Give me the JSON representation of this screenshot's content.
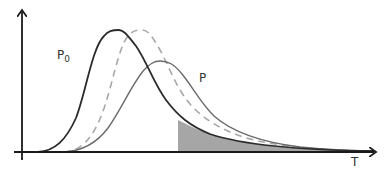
{
  "chart_data": {
    "type": "line",
    "title": "",
    "xlabel": "T",
    "ylabel": "",
    "grid": false,
    "axes": {
      "origin": [
        22,
        152
      ],
      "x_end": 374,
      "y_top": 12,
      "color": "#1a1a1a"
    },
    "series": [
      {
        "name": "P0",
        "label": "P",
        "subscript": "0",
        "style": "solid",
        "color": "#2b2b2b",
        "width": 1.8,
        "path": "M 38 152 C 55 151, 66 140, 76 118 C 86 92, 92 48, 104 36 C 108 31, 112 30, 119 30 C 124 30, 128 36, 136 46 C 146 60, 154 84, 166 100 C 178 116, 190 126, 210 134 C 240 144, 290 150, 374 151",
        "label_pos": [
          57,
          59
        ]
      },
      {
        "name": "shifted-P0",
        "label": "",
        "style": "dashed",
        "color": "#a8a8a8",
        "width": 1.6,
        "path": "M 64 152 C 80 151, 92 140, 102 114 C 112 88, 118 48, 128 36 C 132 31, 136 30, 142 30 C 148 30, 152 36, 160 50 C 168 64, 176 88, 190 104 C 204 120, 222 130, 246 138 C 276 146, 316 150, 374 151"
      },
      {
        "name": "P",
        "label": "P",
        "style": "solid",
        "color": "#6a6a6a",
        "width": 1.4,
        "path": "M 64 152 C 82 151, 96 144, 108 128 C 122 108, 132 84, 144 70 C 150 64, 154 61, 160 61 C 168 61, 174 64, 182 74 C 192 86, 200 102, 214 116 C 232 132, 260 142, 300 147 C 330 150, 350 151, 374 151",
        "label_pos": [
          199,
          82
        ]
      }
    ],
    "shaded_region": {
      "x_start": 178,
      "under_series": "P0",
      "color": "#a6a6a6",
      "path": "M 178 152 L 178 120 C 190 126, 200 131, 210 134 C 240 144, 290 150, 374 151 L 374 152 Z"
    },
    "x_axis_label_pos": [
      351,
      166
    ]
  }
}
